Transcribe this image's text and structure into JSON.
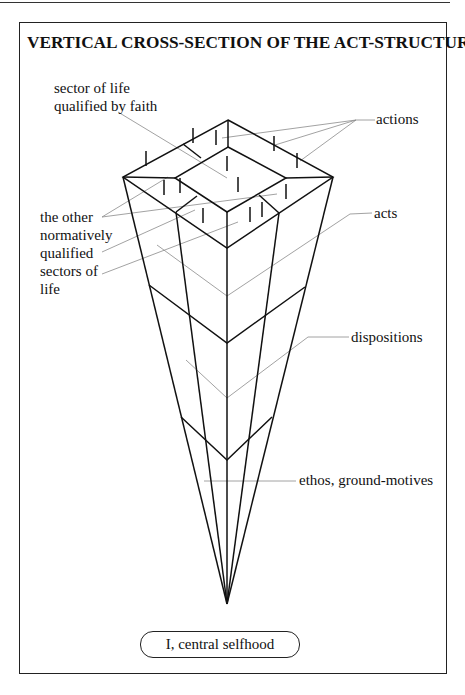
{
  "figure": {
    "title": "VERTICAL CROSS-SECTION OF THE ACT-STRUCTURE",
    "labels": {
      "faith_sector": [
        "sector of life",
        "qualified by faith"
      ],
      "other_sectors": [
        "the other",
        "normatively",
        "qualified",
        "sectors of",
        "life"
      ],
      "actions": "actions",
      "acts": "acts",
      "dispositions": "dispositions",
      "ethos": "ethos, ground-motives"
    },
    "base_label": "I, central selfhood",
    "layers": [
      "actions",
      "acts",
      "dispositions",
      "ethos, ground-motives"
    ],
    "colors": {
      "line": "#111111",
      "leader": "#8a8a8a",
      "frame": "#222222"
    }
  }
}
